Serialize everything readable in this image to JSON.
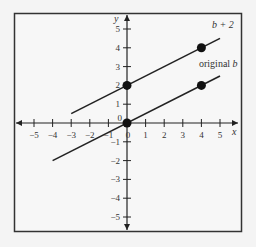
{
  "chart_data": {
    "type": "line",
    "title": "",
    "xlabel": "x",
    "ylabel": "y",
    "xlim": [
      -5,
      5
    ],
    "ylim": [
      -5,
      5
    ],
    "x_ticks": [
      -5,
      -4,
      -3,
      -2,
      -1,
      0,
      1,
      2,
      3,
      4,
      5
    ],
    "y_ticks": [
      -5,
      -4,
      -3,
      -2,
      -1,
      0,
      1,
      2,
      3,
      4,
      5
    ],
    "grid": false,
    "series": [
      {
        "name": "original b",
        "equation_slope": 0.5,
        "intercept": 0,
        "line_x_range": [
          -4,
          5
        ],
        "points": [
          {
            "x": 0,
            "y": 0
          },
          {
            "x": 4,
            "y": 2
          }
        ]
      },
      {
        "name": "b + 2",
        "equation_slope": 0.5,
        "intercept": 2,
        "line_x_range": [
          -3,
          5
        ],
        "points": [
          {
            "x": 0,
            "y": 2
          },
          {
            "x": 4,
            "y": 4
          }
        ]
      }
    ],
    "annotations": [
      {
        "text": "b + 2",
        "near": "upper line"
      },
      {
        "text": "original b",
        "near": "lower line"
      }
    ]
  },
  "labels": {
    "x_axis": "x",
    "y_axis": "y",
    "upper_line": "b + 2",
    "lower_line_prefix": "original ",
    "lower_line_var": "b"
  }
}
